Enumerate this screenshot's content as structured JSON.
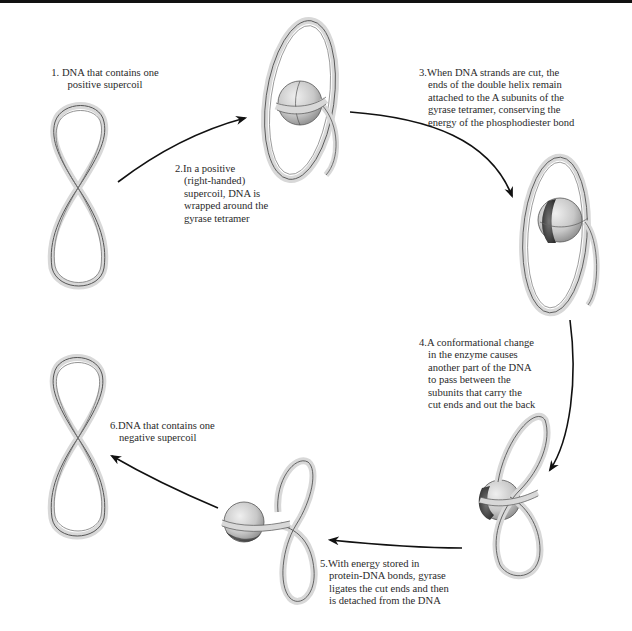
{
  "figure": {
    "colors": {
      "ribbon_fill": "#d9d9d9",
      "ribbon_edge": "#555555",
      "enzyme_light": "#cfcfcf",
      "enzyme_dark": "#4a4a4a",
      "arrow": "#111111",
      "text": "#2a2a2a"
    },
    "steps": [
      {
        "number": "1.",
        "text": "DNA that contains one positive supercoil",
        "lines": [
          "1. DNA that contains one",
          "positive supercoil"
        ]
      },
      {
        "number": "2.",
        "text": "In a positive (right-handed) supercoil, DNA is wrapped around the gyrase tetramer",
        "lines": [
          "2.In a positive",
          "(right-handed)",
          "supercoil, DNA is",
          "wrapped around the",
          "gyrase tetramer"
        ]
      },
      {
        "number": "3.",
        "text": "When DNA strands are cut, the ends of the double helix remain attached to the A subunits of the gyrase tetramer, conserving the energy of the phosphodiester bond",
        "lines": [
          "3.When DNA strands are cut, the",
          "ends of the double helix remain",
          "attached to the A subunits of the",
          "gyrase tetramer, conserving the",
          "energy of the phosphodiester bond"
        ]
      },
      {
        "number": "4.",
        "text": "A conformational change in the enzyme causes another part of the DNA to pass between the subunits that carry the cut ends and out the back",
        "lines": [
          "4.A conformational change",
          "in the enzyme causes",
          "another part of the DNA",
          "to pass between the",
          "subunits that carry the",
          "cut ends and out the back"
        ]
      },
      {
        "number": "5.",
        "text": "With energy stored in protein-DNA bonds, gyrase ligates the cut ends and then is detached from the DNA",
        "lines": [
          "5.With energy stored in",
          "protein-DNA bonds, gyrase",
          "ligates the cut ends and then",
          "is detached from the DNA"
        ]
      },
      {
        "number": "6.",
        "text": "DNA that contains one negative supercoil",
        "lines": [
          "6.DNA that contains one",
          "negative supercoil"
        ]
      }
    ],
    "illustrations": [
      {
        "id": "dna-positive-supercoil",
        "depicts": "figure-eight DNA ribbon, positive supercoil"
      },
      {
        "id": "dna-wrapped-gyrase",
        "depicts": "DNA loop wrapped around gyrase tetramer sphere"
      },
      {
        "id": "dna-cut-gyrase",
        "depicts": "gyrase with cut DNA ends attached to A subunits"
      },
      {
        "id": "dna-passing-gyrase",
        "depicts": "DNA segment passing through enzyme"
      },
      {
        "id": "dna-ligated-gyrase",
        "depicts": "gyrase ligating cut ends, detaching"
      },
      {
        "id": "dna-negative-supercoil",
        "depicts": "figure-eight DNA ribbon, negative supercoil"
      }
    ]
  }
}
